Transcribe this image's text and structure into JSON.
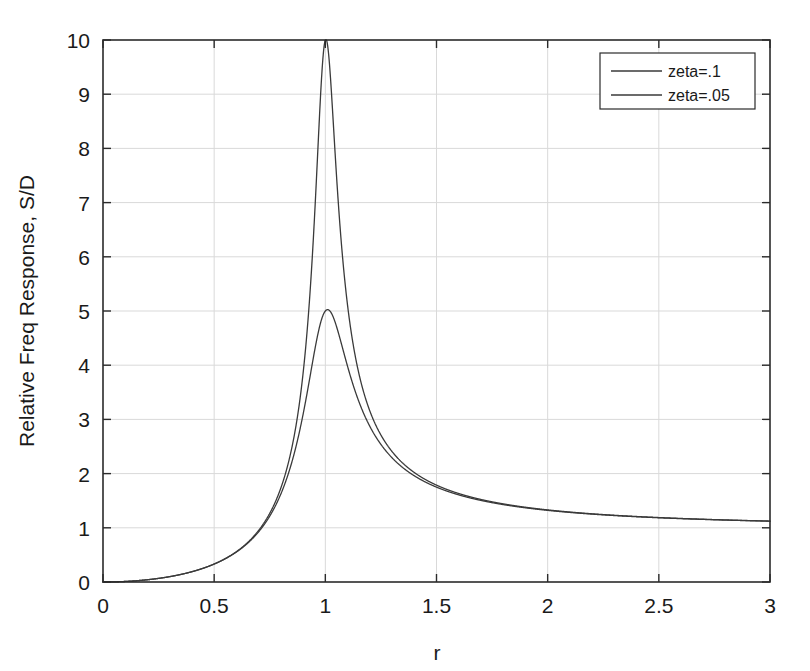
{
  "chart_data": {
    "type": "line",
    "title": "",
    "xlabel": "r",
    "ylabel": "Relative Freq Response, S/D",
    "xlim": [
      0,
      3
    ],
    "ylim": [
      0,
      10
    ],
    "grid": true,
    "legend_position": "top-right",
    "xticks": [
      "0",
      "0.5",
      "1",
      "1.5",
      "2",
      "2.5",
      "3"
    ],
    "xtick_values": [
      0,
      0.5,
      1,
      1.5,
      2,
      2.5,
      3
    ],
    "yticks": [
      "0",
      "1",
      "2",
      "3",
      "4",
      "5",
      "6",
      "7",
      "8",
      "9",
      "10"
    ],
    "ytick_values": [
      0,
      1,
      2,
      3,
      4,
      5,
      6,
      7,
      8,
      9,
      10
    ],
    "formula": "S/D = r^2 / sqrt((1-r^2)^2 + (2*zeta*r)^2)",
    "line_color": "#3a3a3a",
    "grid_color": "#d9d9d9",
    "axis_color": "#2b2b2b",
    "series": [
      {
        "name": "zeta=.1",
        "zeta": 0.1,
        "peak_value": 5.03,
        "peak_r": 1.0,
        "x": [
          0,
          0.1,
          0.2,
          0.3,
          0.4,
          0.5,
          0.6,
          0.7,
          0.8,
          0.85,
          0.9,
          0.95,
          1.0,
          1.05,
          1.1,
          1.15,
          1.2,
          1.3,
          1.4,
          1.5,
          1.75,
          2.0,
          2.25,
          2.5,
          2.75,
          3.0
        ],
        "values": [
          0,
          0.0101,
          0.0417,
          0.0989,
          0.1901,
          0.3328,
          0.5595,
          0.9368,
          1.6903,
          2.3523,
          3.4335,
          4.6609,
          5.0252,
          4.1025,
          3.0212,
          2.2795,
          1.8,
          1.3343,
          1.1394,
          1.0588,
          1.0027,
          1.3284,
          1.2408,
          1.187,
          1.1544,
          1.1336
        ]
      },
      {
        "name": "zeta=.05",
        "zeta": 0.05,
        "peak_value": 10.0,
        "peak_r": 1.0,
        "x": [
          0,
          0.1,
          0.2,
          0.3,
          0.4,
          0.5,
          0.6,
          0.7,
          0.8,
          0.85,
          0.9,
          0.95,
          1.0,
          1.05,
          1.1,
          1.15,
          1.2,
          1.3,
          1.4,
          1.5,
          1.75,
          2.0,
          2.25,
          2.5,
          2.75,
          3.0
        ],
        "values": [
          0,
          0.0101,
          0.0417,
          0.0989,
          0.1901,
          0.3336,
          0.5629,
          0.9554,
          1.7699,
          2.553,
          4.0909,
          6.906,
          10.0,
          5.5836,
          3.4188,
          2.4237,
          1.8669,
          1.3518,
          1.1471,
          1.063,
          1.004,
          1.331,
          1.2425,
          1.1883,
          1.1554,
          1.1344
        ]
      }
    ]
  },
  "axes": {
    "ylabel": "Relative Freq Response, S/D",
    "xlabel": "r"
  },
  "legend": {
    "entries": [
      {
        "label": "zeta=.1"
      },
      {
        "label": "zeta=.05"
      }
    ]
  }
}
